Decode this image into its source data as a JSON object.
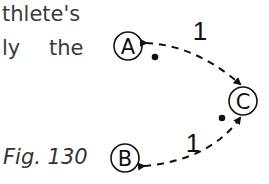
{
  "text": {
    "line1": "thlete's",
    "line2": "ly the",
    "caption": "Fig. 130"
  },
  "diagram": {
    "nodes": [
      {
        "id": "A",
        "label": "A"
      },
      {
        "id": "B",
        "label": "B"
      },
      {
        "id": "C",
        "label": "C"
      }
    ],
    "edges": [
      {
        "from": "C",
        "to": "A",
        "label": "1",
        "style": "dashed",
        "bidirectional": true
      },
      {
        "from": "B",
        "to": "C",
        "label": "1",
        "style": "dashed",
        "bidirectional": true
      }
    ]
  }
}
